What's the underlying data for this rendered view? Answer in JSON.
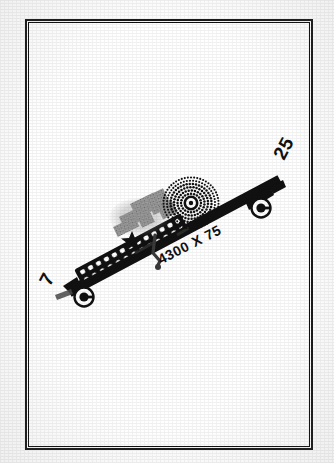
{
  "document": {
    "kind": "airport-sketch",
    "title": "Airport Diagram",
    "background_color": "#ffffff",
    "frame_color": "#1a1a1a"
  },
  "airport_diagram": {
    "runway": {
      "designator_low_end": "7",
      "designator_high_end": "25",
      "dimensions_label": "4300 X 75",
      "length_ft": 4300,
      "width_ft": 75,
      "surface_color": "#111111",
      "bearing_deg": 63
    },
    "labels": {
      "runway_7": "7",
      "runway_25": "25",
      "runway_dimensions": "4300 X 75"
    },
    "symbols": [
      {
        "name": "runway-end-marker-7",
        "type": "circled-dot",
        "label": ""
      },
      {
        "name": "runway-end-marker-25",
        "type": "circled-dot",
        "label": ""
      },
      {
        "name": "airport-beacon-star",
        "type": "star",
        "label": ""
      },
      {
        "name": "obstruction-circle",
        "type": "radial-dotted-circle",
        "label": ""
      },
      {
        "name": "apron-tiedowns",
        "type": "dotted-band",
        "label": ""
      },
      {
        "name": "building-cluster",
        "type": "gray-blocks",
        "label": ""
      },
      {
        "name": "taxiway-stub",
        "type": "stub",
        "label": ""
      }
    ]
  }
}
